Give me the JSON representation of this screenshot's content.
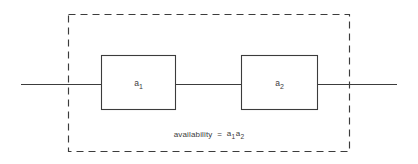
{
  "diagram": {
    "kind": "reliability-block-diagram",
    "topology": "series",
    "background_color": "#ffffff",
    "line_color": "#3c3c3c",
    "blocks": [
      {
        "id": "block-a1",
        "label_base": "a",
        "label_sub": "1",
        "x": 101,
        "y": 55,
        "width": 75,
        "height": 55
      },
      {
        "id": "block-a2",
        "label_base": "a",
        "label_sub": "2",
        "x": 241,
        "y": 55,
        "width": 77,
        "height": 55
      }
    ],
    "caption": {
      "lead": "availability",
      "equals": "=",
      "term1_base": "a",
      "term1_sub": "1",
      "term2_base": "a",
      "term2_sub": "2",
      "full_text": "availability = a1a2"
    },
    "boundary": {
      "label": "system-boundary",
      "x": 68,
      "y": 14,
      "width": 282,
      "height": 138,
      "style": "dashed"
    },
    "wires": {
      "input_lead": {
        "x1": 21,
        "y1": 84,
        "x2": 101,
        "y2": 84
      },
      "middle_lead": {
        "x1": 176,
        "y1": 84,
        "x2": 241,
        "y2": 84
      },
      "output_lead": {
        "x1": 318,
        "y1": 84,
        "x2": 397,
        "y2": 84
      }
    }
  }
}
